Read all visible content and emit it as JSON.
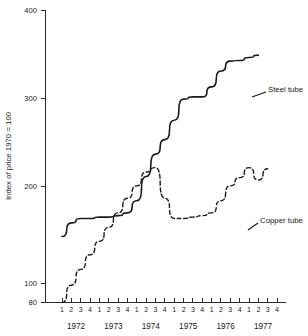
{
  "chart_data": {
    "type": "line",
    "title": "",
    "xlabel": "",
    "ylabel": "Index of price 1970 = 100",
    "yscale": "log",
    "ylim": [
      80,
      400
    ],
    "yticks": [
      80,
      100,
      200,
      300,
      400
    ],
    "ytick_labels": [
      "80",
      "100",
      "200",
      "300",
      "400"
    ],
    "grid": false,
    "legend_position": "right-inline",
    "x": [
      "1972 Q1",
      "1972 Q2",
      "1972 Q3",
      "1972 Q4",
      "1973 Q1",
      "1973 Q2",
      "1973 Q3",
      "1973 Q4",
      "1974 Q1",
      "1974 Q2",
      "1974 Q3",
      "1974 Q4",
      "1975 Q1",
      "1975 Q2",
      "1975 Q3",
      "1975 Q4",
      "1976 Q1",
      "1976 Q2",
      "1976 Q3",
      "1976 Q4",
      "1977 Q1",
      "1977 Q2",
      "1977 Q3",
      "1977 Q4"
    ],
    "quarter_tick_labels": [
      "1",
      "2",
      "3",
      "4",
      "1",
      "2",
      "3",
      "4",
      "1",
      "2",
      "3",
      "4",
      "1",
      "2",
      "3",
      "4",
      "1",
      "2",
      "3",
      "4",
      "1",
      "2",
      "3",
      "4"
    ],
    "year_labels": [
      "1972",
      "1973",
      "1974",
      "1975",
      "1976",
      "1977"
    ],
    "series": [
      {
        "name": "Steel tube",
        "style": "solid",
        "color": "#1a1a1a",
        "values": [
          115,
          124,
          127,
          127,
          128,
          128,
          129,
          131,
          140,
          160,
          181,
          196,
          218,
          245,
          248,
          248,
          262,
          286,
          302,
          303,
          308,
          312,
          null,
          null
        ]
      },
      {
        "name": "Copper tube",
        "style": "dashed",
        "color": "#1a1a1a",
        "values": [
          80,
          88,
          96,
          104,
          112,
          121,
          131,
          142,
          152,
          164,
          168,
          142,
          127,
          127,
          128,
          129,
          131,
          140,
          152,
          159,
          168,
          157,
          167,
          null
        ]
      }
    ],
    "annotations": [
      {
        "text": "Steel tube",
        "series": "Steel tube"
      },
      {
        "text": "Copper tube",
        "series": "Copper tube"
      }
    ]
  }
}
